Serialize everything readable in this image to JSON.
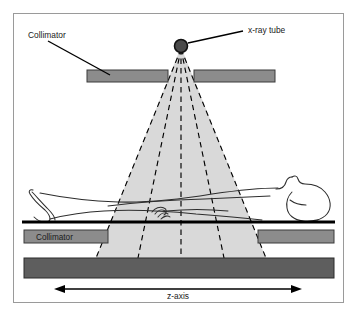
{
  "figure": {
    "frame": {
      "border_color": "#9a9a9a",
      "background": "#ffffff",
      "x": 13,
      "y": 13,
      "width": 331,
      "height": 290
    },
    "labels": {
      "collimator_upper": "Collimator",
      "collimator_lower": "Collimator",
      "xray_tube": "x-ray tube",
      "z_axis": "z-axis"
    },
    "colors": {
      "collimator_fill": "#8c8c8c",
      "collimator_stroke": "#3a3a3a",
      "detector_fill": "#5e5e5e",
      "detector_stroke": "#2b2b2b",
      "beam_fill": "#d9d9d9",
      "ray_stroke": "#000000",
      "tube_fill": "#4a4a4a",
      "tube_stroke": "#111111",
      "table_line": "#000000",
      "body_outline": "#2d2d2d",
      "text": "#1a1a1a",
      "leader_line": "#000000"
    },
    "geometry": {
      "tube_apex_x": 181,
      "tube_apex_y": 46,
      "tube_radius": 6.5,
      "beam_left_bottom_x": 96,
      "beam_right_bottom_x": 266,
      "beam_bottom_y": 258,
      "table_line_y": 222,
      "detector_top_y": 258,
      "detector_bottom_y": 278,
      "collimator_upper_y": 70,
      "collimator_upper_height": 12,
      "collimator_lower_y": 230,
      "collimator_lower_height": 12,
      "z_axis_y": 289,
      "z_axis_left_x": 56,
      "z_axis_right_x": 300,
      "ray_count": 5
    },
    "elements": {
      "xray_tube": "x-ray-tube-source",
      "fan_beam": "fan-beam",
      "rays": "x-ray-beam-rays",
      "collimator_upper_left": "upper-left-collimator-bar",
      "collimator_upper_right": "upper-right-collimator-bar",
      "collimator_lower_left": "lower-left-collimator-bar",
      "collimator_lower_right": "lower-right-collimator-bar",
      "detector": "detector-array",
      "patient": "supine-patient-outline",
      "table": "patient-table-line",
      "z_axis_arrow": "z-axis-double-arrow"
    }
  }
}
